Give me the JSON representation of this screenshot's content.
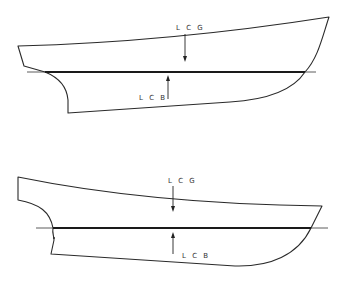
{
  "diagram": {
    "colors": {
      "line": "#2a2a2a",
      "background": "#ffffff"
    },
    "figures": [
      {
        "id": "upper",
        "labels": {
          "lcg": "L C G",
          "lcb": "L C B"
        },
        "arrows": {
          "lcg": "down",
          "lcb": "up"
        }
      },
      {
        "id": "lower",
        "labels": {
          "lcg": "L C G",
          "lcb": "L C B"
        },
        "arrows": {
          "lcg": "down",
          "lcb": "up"
        }
      }
    ]
  }
}
